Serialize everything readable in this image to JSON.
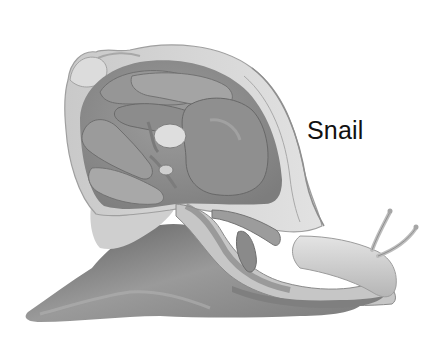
{
  "figure": {
    "label": "Snail",
    "style": "grayscale",
    "parts_depicted": [
      "shell (cut open)",
      "shell apex",
      "mantle",
      "internal organs",
      "foot",
      "head",
      "tentacles"
    ]
  },
  "colors": {
    "background": "#ffffff",
    "label_text": "#111111",
    "shell_light": "#d9d9d9",
    "shell_mid": "#b8b8b8",
    "organ_dark": "#8a8a8a",
    "organ_mid": "#a3a3a3",
    "foot_dark": "#7a7a7a",
    "highlight": "#ececec"
  }
}
